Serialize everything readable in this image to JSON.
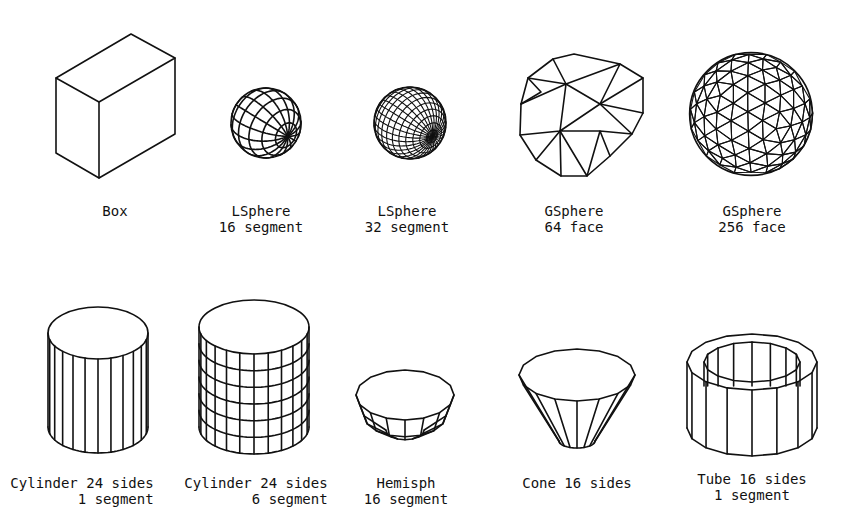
{
  "figure": {
    "background": "#ffffff",
    "stroke_color": "#111111",
    "rows": [
      {
        "items": [
          {
            "id": "box",
            "shape": "box",
            "label_lines": [
              "Box"
            ],
            "cx": 115,
            "label_y": 203
          },
          {
            "id": "lsphere16",
            "shape": "lsphere",
            "segments": 16,
            "label_lines": [
              "LSphere",
              "16 segment"
            ],
            "cx": 261,
            "label_y": 203
          },
          {
            "id": "lsphere32",
            "shape": "lsphere",
            "segments": 32,
            "label_lines": [
              "LSphere",
              "32 segment"
            ],
            "cx": 407,
            "label_y": 203
          },
          {
            "id": "gsphere64",
            "shape": "gsphere",
            "faces": 64,
            "label_lines": [
              "GSphere",
              "64 face"
            ],
            "cx": 574,
            "label_y": 203
          },
          {
            "id": "gsphere256",
            "shape": "gsphere",
            "faces": 256,
            "label_lines": [
              "GSphere",
              "256 face"
            ],
            "cx": 752,
            "label_y": 203
          }
        ]
      },
      {
        "items": [
          {
            "id": "cylinder1",
            "shape": "cylinder",
            "sides": 24,
            "segments": 1,
            "label_lines": [
              "Cylinder 24 sides",
              "   1 segment"
            ],
            "cx": 82,
            "label_y": 475
          },
          {
            "id": "cylinder6",
            "shape": "cylinder",
            "sides": 24,
            "segments": 6,
            "label_lines": [
              "Cylinder 24 sides",
              "   6 segment"
            ],
            "cx": 256,
            "label_y": 475
          },
          {
            "id": "hemisph",
            "shape": "hemisphere",
            "segments": 16,
            "label_lines": [
              "Hemisph",
              "16 segment"
            ],
            "cx": 406,
            "label_y": 475
          },
          {
            "id": "cone",
            "shape": "cone",
            "sides": 16,
            "label_lines": [
              "Cone 16 sides"
            ],
            "cx": 577,
            "label_y": 475
          },
          {
            "id": "tube",
            "shape": "tube",
            "sides": 16,
            "segments": 1,
            "label_lines": [
              "Tube 16 sides",
              "1 segment"
            ],
            "cx": 752,
            "label_y": 471
          }
        ]
      }
    ]
  }
}
